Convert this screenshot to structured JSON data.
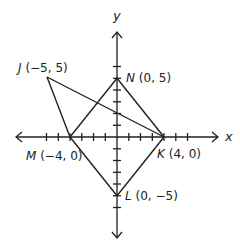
{
  "figure": {
    "title": "",
    "origin_px": [
      117,
      137
    ],
    "unit_px": 11.75,
    "axes": {
      "x_label": "x",
      "y_label": "y",
      "x_ticks": [
        -6,
        -5,
        -4,
        -3,
        -2,
        -1,
        1,
        2,
        3,
        4,
        5,
        6
      ],
      "y_ticks": [
        -6,
        -5,
        -4,
        -3,
        -2,
        -1,
        1,
        2,
        3,
        4,
        5,
        6
      ]
    },
    "points": {
      "J": {
        "name": "J",
        "coords": "(−5, 5)",
        "x": -5,
        "y": 5
      },
      "N": {
        "name": "N",
        "coords": "(0, 5)",
        "x": 0,
        "y": 5
      },
      "M": {
        "name": "M",
        "coords": "(−4, 0)",
        "x": -4,
        "y": 0
      },
      "K": {
        "name": "K",
        "coords": "(4, 0)",
        "x": 4,
        "y": 0
      },
      "L": {
        "name": "L",
        "coords": "(0, −5)",
        "x": 0,
        "y": -5
      }
    },
    "segments": [
      [
        "J",
        "K"
      ],
      [
        "J",
        "M"
      ],
      [
        "M",
        "N"
      ],
      [
        "N",
        "K"
      ],
      [
        "M",
        "L"
      ],
      [
        "L",
        "K"
      ]
    ],
    "colors": {
      "line": "#231f20",
      "background": "#ffffff"
    }
  }
}
